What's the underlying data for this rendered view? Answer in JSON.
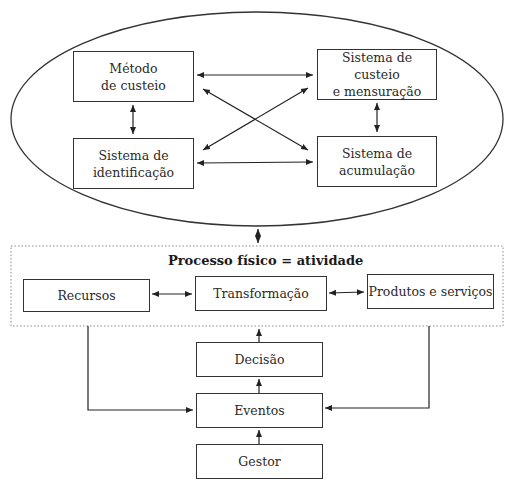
{
  "diagram": {
    "ellipse_group": {
      "boxes": {
        "metodo": {
          "line1": "Método",
          "line2": "de custeio"
        },
        "custeio": {
          "line1": "Sistema de custeio",
          "line2": "e mensuração"
        },
        "identificacao": {
          "line1": "Sistema de",
          "line2": "identificação"
        },
        "acumulacao": {
          "line1": "Sistema de",
          "line2": "acumulação"
        }
      }
    },
    "process_group": {
      "title": "Processo físico = atividade",
      "boxes": {
        "recursos": "Recursos",
        "transformacao": "Transformação",
        "produtos": "Produtos e serviços"
      }
    },
    "control_chain": {
      "decisao": "Decisão",
      "eventos": "Eventos",
      "gestor": "Gestor"
    },
    "colors": {
      "stroke": "#333333",
      "dotted_border": "#8a8a8a",
      "background": "#ffffff"
    }
  }
}
